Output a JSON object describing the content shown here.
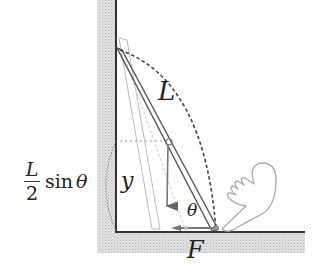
{
  "diagram": {
    "labels": {
      "rod_length": "L",
      "height": "y",
      "angle": "θ",
      "force": "F",
      "expression_numerator": "L",
      "expression_denominator": "2",
      "expression_function": "sin",
      "expression_angle": "θ"
    },
    "colors": {
      "wall_line": "#333333",
      "hatch": "#cfcfcf",
      "rod": "#555555",
      "ghost_rod": "#aaaaaa",
      "arc": "#444444"
    }
  }
}
